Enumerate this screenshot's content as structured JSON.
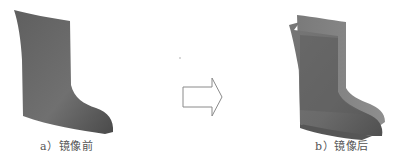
{
  "figure": {
    "panels": [
      {
        "id": "a",
        "caption": "a）镜像前",
        "description": "single boot surface before mirroring",
        "fill_color": "#6e6e6e"
      },
      {
        "id": "b",
        "caption": "b）镜像后",
        "description": "boot surface with mirrored copy after mirroring",
        "fill_color": "#6e6e6e",
        "mirror_fill_color": "#8a8a8a"
      }
    ],
    "arrow": {
      "icon": "right-arrow-icon",
      "stroke_color": "#888888"
    }
  }
}
